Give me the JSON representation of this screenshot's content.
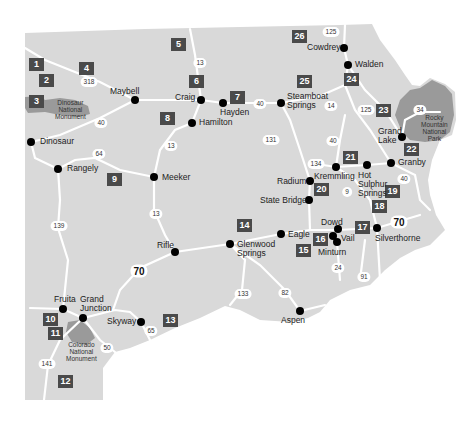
{
  "map": {
    "colors": {
      "land": "#d9d9d9",
      "road": "#ffffff",
      "park": "#9a9a9a",
      "badge": "#4a4a4a",
      "background": "#ffffff"
    },
    "towns": [
      {
        "name": "Maybell",
        "x": 135,
        "y": 100
      },
      {
        "name": "Craig",
        "x": 201,
        "y": 100
      },
      {
        "name": "Hayden",
        "x": 223,
        "y": 103
      },
      {
        "name": "Hamilton",
        "x": 192,
        "y": 123
      },
      {
        "name": "Steamboat Springs",
        "x": 281,
        "y": 103
      },
      {
        "name": "Cowdrey",
        "x": 344,
        "y": 48
      },
      {
        "name": "Walden",
        "x": 348,
        "y": 65
      },
      {
        "name": "Grand Lake",
        "x": 402,
        "y": 137
      },
      {
        "name": "Granby",
        "x": 391,
        "y": 163
      },
      {
        "name": "Hot Sulphur Springs",
        "x": 367,
        "y": 165
      },
      {
        "name": "Kremmling",
        "x": 336,
        "y": 167
      },
      {
        "name": "Radium",
        "x": 310,
        "y": 181
      },
      {
        "name": "State Bridge",
        "x": 309,
        "y": 200
      },
      {
        "name": "Dowd",
        "x": 337,
        "y": 230
      },
      {
        "name": "Vail",
        "x": 334,
        "y": 238
      },
      {
        "name": "Minturn",
        "x": 337,
        "y": 242
      },
      {
        "name": "Silverthorne",
        "x": 377,
        "y": 228
      },
      {
        "name": "Eagle",
        "x": 281,
        "y": 234
      },
      {
        "name": "Glenwood Springs",
        "x": 230,
        "y": 244
      },
      {
        "name": "Rifle",
        "x": 175,
        "y": 252
      },
      {
        "name": "Meeker",
        "x": 154,
        "y": 177
      },
      {
        "name": "Rangely",
        "x": 58,
        "y": 169
      },
      {
        "name": "Dinosaur",
        "x": 31,
        "y": 142
      },
      {
        "name": "Fruita",
        "x": 63,
        "y": 309
      },
      {
        "name": "Grand Junction",
        "x": 83,
        "y": 318
      },
      {
        "name": "Skyway",
        "x": 141,
        "y": 322
      },
      {
        "name": "Aspen",
        "x": 300,
        "y": 311
      }
    ],
    "regions": [
      "1",
      "2",
      "3",
      "4",
      "5",
      "6",
      "7",
      "8",
      "9",
      "10",
      "11",
      "12",
      "13",
      "14",
      "15",
      "16",
      "17",
      "18",
      "19",
      "20",
      "21",
      "22",
      "23",
      "24",
      "25",
      "26"
    ],
    "highways": [
      "318",
      "13",
      "40",
      "125",
      "14",
      "34",
      "131",
      "134",
      "9",
      "64",
      "139",
      "70",
      "133",
      "82",
      "24",
      "91",
      "65",
      "50",
      "141"
    ],
    "parks": [
      {
        "name": "Dinosaur National Monument"
      },
      {
        "name": "Rocky Mountain National Park"
      },
      {
        "name": "Colorado National Monument"
      }
    ]
  },
  "labels": {
    "maybell": "Maybell",
    "craig": "Craig",
    "hayden": "Hayden",
    "hamilton": "Hamilton",
    "steamboat1": "Steamboat",
    "steamboat2": "Springs",
    "cowdrey": "Cowdrey",
    "walden": "Walden",
    "grandlake1": "Grand",
    "grandlake2": "Lake",
    "granby": "Granby",
    "hot1": "Hot",
    "hot2": "Sulphur",
    "hot3": "Springs",
    "kremmling": "Kremmling",
    "radium": "Radium",
    "statebridge": "State Bridge",
    "dowd": "Dowd",
    "vail": "Vail",
    "minturn": "Minturn",
    "silverthorne": "Silverthorne",
    "eagle": "Eagle",
    "glenwood1": "Glenwood",
    "glenwood2": "Springs",
    "rifle": "Rifle",
    "meeker": "Meeker",
    "rangely": "Rangely",
    "dinosaur": "Dinosaur",
    "fruita": "Fruita",
    "gj1": "Grand",
    "gj2": "Junction",
    "skyway": "Skyway",
    "aspen": "Aspen",
    "dnm1": "Dinosaur",
    "dnm2": "National",
    "dnm3": "Monument",
    "rmnp1": "Rocky",
    "rmnp2": "Mountain",
    "rmnp3": "National",
    "rmnp4": "Park",
    "cnm1": "Colorado",
    "cnm2": "National",
    "cnm3": "Monument"
  }
}
